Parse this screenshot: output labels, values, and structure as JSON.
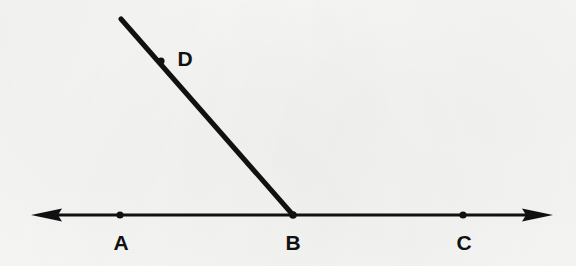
{
  "figure": {
    "kind": "geometry-diagram",
    "background_color": "#f8f8f7",
    "ink_color": "#111111",
    "line_ac": {
      "label": "line-AC",
      "left_arrow_tip": {
        "x": 31,
        "y": 215
      },
      "right_arrow_tip": {
        "x": 553,
        "y": 215
      },
      "stroke_width": 3,
      "arrowheads": "both"
    },
    "ray_bd": {
      "label": "ray-BD",
      "from": {
        "x": 293,
        "y": 215
      },
      "to": {
        "x": 121,
        "y": 19
      },
      "stroke_width": 5,
      "arrowheads": "none"
    },
    "points": [
      {
        "id": "A",
        "label": "A",
        "x": 120,
        "y": 215,
        "label_x": 121,
        "label_y": 232,
        "dot_radius": 3.6
      },
      {
        "id": "B",
        "label": "B",
        "x": 293,
        "y": 215,
        "label_x": 293,
        "label_y": 232,
        "dot_radius": 3.8
      },
      {
        "id": "C",
        "label": "C",
        "x": 463,
        "y": 215,
        "label_x": 464,
        "label_y": 232,
        "dot_radius": 3.6
      },
      {
        "id": "D",
        "label": "D",
        "x": 161,
        "y": 61,
        "label_x": 185,
        "label_y": 48,
        "dot_radius": 3.6
      }
    ]
  }
}
